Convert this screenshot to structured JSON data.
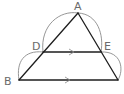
{
  "diagram": {
    "type": "geometry",
    "labels": {
      "A": "A",
      "B": "B",
      "D": "D",
      "E": "E"
    },
    "points": {
      "A": [
        78,
        13
      ],
      "B": [
        19,
        80
      ],
      "C": [
        118,
        80
      ],
      "D": [
        43,
        52
      ],
      "E": [
        101,
        52
      ]
    },
    "segments": [
      [
        "A",
        "B"
      ],
      [
        "A",
        "C"
      ],
      [
        "D",
        "E"
      ],
      [
        "B",
        "C"
      ]
    ],
    "parallel_marks": [
      "DE",
      "BC"
    ],
    "arcs": [
      {
        "from": "D",
        "to": "A"
      },
      {
        "from": "A",
        "to": "E"
      },
      {
        "from": "B",
        "to": "D"
      },
      {
        "from": "E",
        "to": "C"
      }
    ],
    "colors": {
      "lines": "#1e1e1e",
      "arcs": "#8a8a8a",
      "labels": "#6a6a6a"
    }
  }
}
